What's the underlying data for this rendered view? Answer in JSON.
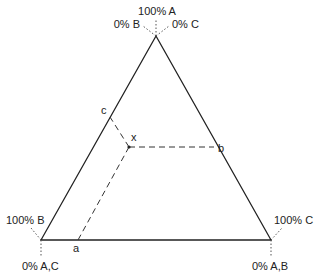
{
  "diagram": {
    "type": "ternary",
    "vertices": {
      "top": {
        "label_main": "100% A",
        "label_left": "0% B",
        "label_right": "0% C"
      },
      "bottom_left": {
        "label_upper": "100% B",
        "label_lower": "0% A,C"
      },
      "bottom_right": {
        "label_upper": "100% C",
        "label_lower": "0% A,B"
      }
    },
    "points": {
      "x": "x",
      "a": "a",
      "b": "b",
      "c": "c"
    }
  }
}
